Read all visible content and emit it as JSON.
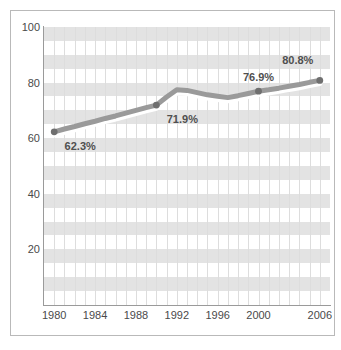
{
  "chart_data": {
    "type": "line",
    "title": "",
    "subtitle": "",
    "xlabel": "",
    "ylabel": "",
    "xlim": [
      1979,
      2007
    ],
    "ylim": [
      0,
      100
    ],
    "grid": "horizontal alternating bands plus vertical yearly gridlines",
    "legend": "none",
    "x_tick_labels": [
      "1980",
      "1984",
      "1988",
      "1992",
      "1996",
      "2000",
      "2006"
    ],
    "x_tick_values": [
      1980,
      1984,
      1988,
      1992,
      1996,
      2000,
      2006
    ],
    "y_tick_labels": [
      "20",
      "40",
      "60",
      "80",
      "100"
    ],
    "y_tick_values": [
      20,
      40,
      60,
      80,
      100
    ],
    "series": [
      {
        "name": "Percent",
        "color": "#9a9a9a",
        "marker_color": "#6f6f6f",
        "x": [
          1980,
          1981,
          1982,
          1983,
          1984,
          1985,
          1986,
          1987,
          1988,
          1989,
          1990,
          1991,
          1992,
          1993,
          1994,
          1995,
          1996,
          1997,
          1998,
          1999,
          2000,
          2001,
          2002,
          2003,
          2004,
          2005,
          2006
        ],
        "values": [
          62.3,
          63.3,
          64.2,
          65.2,
          66.1,
          67.1,
          68.0,
          69.0,
          70.0,
          71.0,
          71.9,
          74.8,
          77.4,
          77.2,
          76.4,
          75.6,
          75.1,
          74.6,
          75.3,
          76.1,
          76.9,
          77.4,
          78.0,
          78.7,
          79.3,
          80.1,
          80.8
        ]
      }
    ],
    "point_labels": [
      {
        "x": 1980,
        "value": 62.3,
        "text": "62.3%",
        "position": "below-right"
      },
      {
        "x": 1990,
        "value": 71.9,
        "text": "71.9%",
        "position": "below-right"
      },
      {
        "x": 2000,
        "value": 76.9,
        "text": "76.9%",
        "position": "above"
      },
      {
        "x": 2006,
        "value": 80.8,
        "text": "80.8%",
        "position": "above-left"
      }
    ],
    "marked_points": [
      {
        "x": 1980,
        "value": 62.3
      },
      {
        "x": 1990,
        "value": 71.9
      },
      {
        "x": 2000,
        "value": 76.9
      },
      {
        "x": 2006,
        "value": 80.8
      }
    ],
    "colors": {
      "line": "#9a9a9a",
      "line_highlight": "#ffffff",
      "marker": "#6f6f6f",
      "band": "#e3e3e3",
      "gridline": "#dddddd",
      "axis": "#9a9a9a",
      "text": "#4a4a4a",
      "frame": "#b9b9b9",
      "background": "#ffffff"
    }
  }
}
